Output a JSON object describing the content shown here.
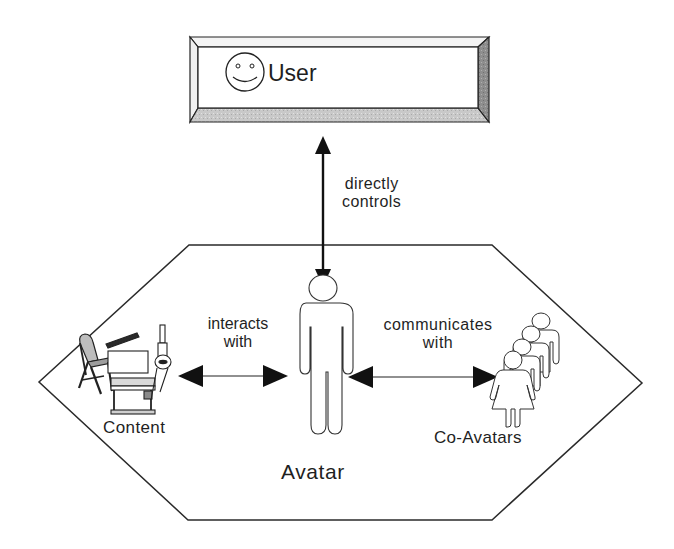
{
  "diagram": {
    "type": "concept-diagram",
    "user_box": {
      "label": "User",
      "icon": "smiley-face-icon",
      "style": "beveled-3d-frame"
    },
    "environment": {
      "shape": "hexagon",
      "nodes": [
        {
          "id": "content",
          "label": "Content",
          "icon": "classroom-objects-icon (chair, desk, projector, lamp)"
        },
        {
          "id": "avatar",
          "label": "Avatar",
          "icon": "male-figure-icon"
        },
        {
          "id": "co_avatars",
          "label": "Co-Avatars",
          "icon": "group-of-figures-icon"
        }
      ]
    },
    "edges": [
      {
        "from": "user",
        "to": "avatar",
        "direction": "bidirectional",
        "label_line1": "directly",
        "label_line2": "controls"
      },
      {
        "from": "content",
        "to": "avatar",
        "direction": "bidirectional",
        "label_line1": "interacts",
        "label_line2": "with"
      },
      {
        "from": "avatar",
        "to": "co_avatars",
        "direction": "bidirectional",
        "label_line1": "communicates",
        "label_line2": "with"
      }
    ],
    "colors": {
      "line": "#222222",
      "bevel_light": "#f2f2f2",
      "bevel_mid": "#cfcfcf",
      "bevel_dark": "#9a9a9a",
      "fill": "#ffffff"
    }
  }
}
